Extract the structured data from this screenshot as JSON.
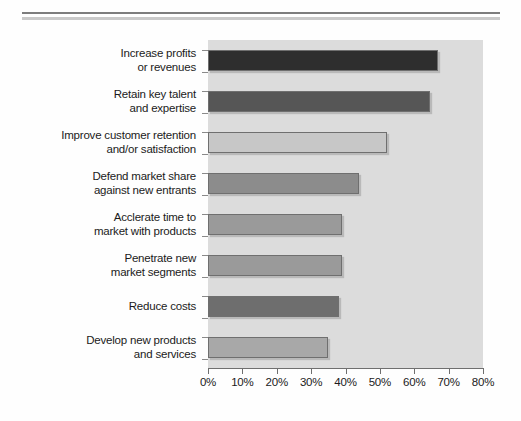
{
  "figure": {
    "background_color": "#fefefe",
    "plot_background_color": "#dcdcdc",
    "rule_dark_color": "#7d7d7d",
    "rule_light_color": "#c9c9c9"
  },
  "chart_data": {
    "type": "bar",
    "orientation": "horizontal",
    "title": "",
    "subtitle": "",
    "xlabel": "",
    "ylabel": "",
    "xlim": [
      0,
      80
    ],
    "xtick_labels": [
      "0%",
      "10%",
      "20%",
      "30%",
      "40%",
      "50%",
      "60%",
      "70%",
      "80%"
    ],
    "xticks": [
      0,
      10,
      20,
      30,
      40,
      50,
      60,
      70,
      80
    ],
    "grid": false,
    "legend": null,
    "categories": [
      "Increase profits or revenues",
      "Retain key talent and expertise",
      "Improve customer retention and/or satisfaction",
      "Defend market share against new entrants",
      "Acclerate time to market with products",
      "Penetrate new market segments",
      "Reduce costs",
      "Develop new products and services"
    ],
    "category_lines": [
      [
        "Increase profits",
        "or revenues"
      ],
      [
        "Retain key talent",
        "and expertise"
      ],
      [
        "Improve customer retention",
        "and/or satisfaction"
      ],
      [
        "Defend market share",
        "against new entrants"
      ],
      [
        "Acclerate time to",
        "market with products"
      ],
      [
        "Penetrate new",
        "market segments"
      ],
      [
        "Reduce costs"
      ],
      [
        "Develop new products",
        "and services"
      ]
    ],
    "values": [
      67,
      64.5,
      52,
      44,
      39,
      39,
      38,
      35
    ],
    "bar_colors": [
      "#2e2e2e",
      "#565656",
      "#c7c7c7",
      "#8c8c8c",
      "#9a9a9a",
      "#9a9a9a",
      "#6e6e6e",
      "#a8a8a8"
    ],
    "bar_edge_color": "#6f6f6f"
  }
}
